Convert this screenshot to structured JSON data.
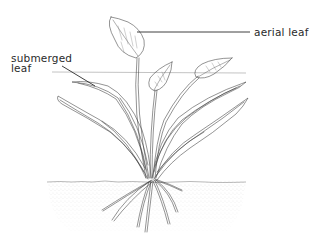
{
  "diagram": {
    "labels": {
      "aerial_leaf": "aerial leaf",
      "submerged_leaf_line1": "submerged",
      "submerged_leaf_line2": "leaf"
    },
    "colors": {
      "ink": "#3a3a3a",
      "soil_stipple": "#bdbdbd",
      "background": "#ffffff"
    }
  }
}
